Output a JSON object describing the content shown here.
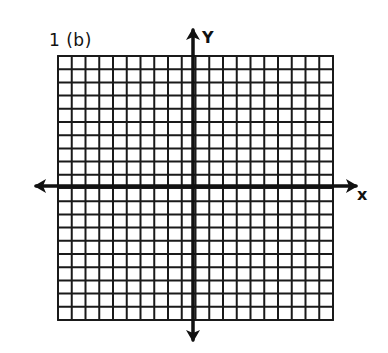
{
  "problem_label": "1 (b)",
  "axes": {
    "x_label": "x",
    "y_label": "Y"
  },
  "grid": {
    "columns": 20,
    "rows": 20,
    "left": 58,
    "right": 333,
    "top": 56,
    "bottom": 320,
    "line_color": "#1a1a1a",
    "axis_color": "#111111"
  },
  "x_axis": {
    "y": 186,
    "x_start": 36,
    "x_end": 356
  },
  "y_axis": {
    "x": 193,
    "y_start": 30,
    "y_end": 340
  }
}
